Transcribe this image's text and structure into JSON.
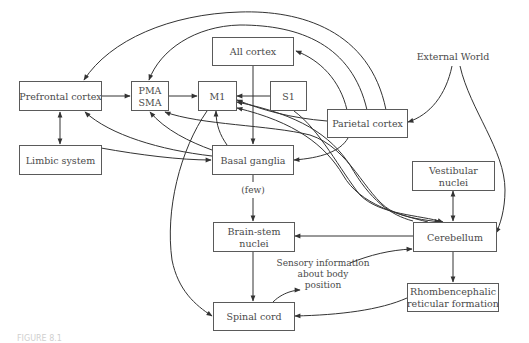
{
  "diagram": {
    "type": "flow-diagram",
    "nodes": {
      "prefrontal": "Prefrontal cortex",
      "limbic": "Limbic system",
      "pma_line1": "PMA",
      "pma_line2": "SMA",
      "m1": "M1",
      "s1": "S1",
      "all_cortex": "All cortex",
      "parietal": "Parietal cortex",
      "basal": "Basal ganglia",
      "brainstem_line1": "Brain-stem",
      "brainstem_line2": "nuclei",
      "spinal": "Spinal cord",
      "vestibular_line1": "Vestibular",
      "vestibular_line2": "nuclei",
      "cerebellum": "Cerebellum",
      "rhomb_line1": "Rhombencephalic",
      "rhomb_line2": "reticular formation",
      "external_world": "External World"
    },
    "annotations": {
      "few": "(few)",
      "sensory_line1": "Sensory information",
      "sensory_line2": "about body",
      "sensory_line3": "position"
    },
    "edges": [
      {
        "from": "Prefrontal cortex",
        "to": "PMA/SMA"
      },
      {
        "from": "PMA/SMA",
        "to": "M1"
      },
      {
        "from": "S1",
        "to": "M1"
      },
      {
        "from": "Prefrontal cortex",
        "to": "Limbic system",
        "bidirectional": true
      },
      {
        "from": "All cortex",
        "to": "Basal ganglia"
      },
      {
        "from": "Basal ganglia",
        "to": "M1"
      },
      {
        "from": "Basal ganglia",
        "to": "PMA/SMA"
      },
      {
        "from": "Basal ganglia",
        "to": "Prefrontal cortex"
      },
      {
        "from": "Prefrontal cortex",
        "to": "Basal ganglia"
      },
      {
        "from": "Parietal cortex",
        "to": "Prefrontal cortex"
      },
      {
        "from": "Parietal cortex",
        "to": "PMA/SMA"
      },
      {
        "from": "Parietal cortex",
        "to": "All cortex"
      },
      {
        "from": "Parietal cortex",
        "to": "M1"
      },
      {
        "from": "Parietal cortex",
        "to": "Basal ganglia"
      },
      {
        "from": "External World",
        "to": "Parietal cortex"
      },
      {
        "from": "External World",
        "to": "Cerebellum"
      },
      {
        "from": "Basal ganglia",
        "to": "Brain-stem nuclei",
        "label": "(few)"
      },
      {
        "from": "Brain-stem nuclei",
        "to": "Spinal cord"
      },
      {
        "from": "M1",
        "to": "Spinal cord"
      },
      {
        "from": "Cerebellum",
        "to": "Brain-stem nuclei"
      },
      {
        "from": "Spinal cord",
        "to": "Cerebellum",
        "label": "Sensory information about body position"
      },
      {
        "from": "Cerebellum",
        "to": "Vestibular nuclei",
        "bidirectional": true
      },
      {
        "from": "Cerebellum",
        "to": "Rhombencephalic reticular formation"
      },
      {
        "from": "Rhombencephalic reticular formation",
        "to": "Spinal cord"
      },
      {
        "from": "M1",
        "to": "Cerebellum",
        "bidirectional": true
      },
      {
        "from": "PMA/SMA",
        "to": "Cerebellum",
        "bidirectional": true
      },
      {
        "from": "S1",
        "to": "Cerebellum"
      }
    ]
  },
  "caption": "FIGURE 8.1"
}
